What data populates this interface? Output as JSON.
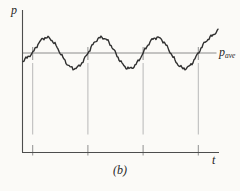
{
  "window": {
    "width": 240,
    "height": 191
  },
  "labels": {
    "y_axis": "p",
    "x_axis": "t",
    "caption": "(b)",
    "mean": {
      "main": "p",
      "sub": "ave"
    }
  },
  "colors": {
    "background": "#fbfaf7",
    "axis": "#4d4d4d",
    "curve": "#303030",
    "mean_line": "#8c8c8c",
    "guide_line": "#b8b8b8",
    "guide_tick": "#909090",
    "text": "#1f1f1f"
  },
  "chart_data": {
    "type": "line",
    "title": "",
    "xlabel": "t",
    "ylabel": "p",
    "mean_line_label": "p_ave",
    "cycles_shown": 3.4,
    "grid": false,
    "axes": {
      "origin_px": [
        22,
        152.5
      ],
      "y_top_px": 10,
      "x_right_px": 219
    },
    "mean_y_px": 53,
    "mean_x_range_px": [
      23,
      216.5
    ],
    "amplitude_px": 15.5,
    "period_px": 55.2,
    "first_rising_crossing_x_px": 32.7,
    "rising_crossings_x_px": [
      32.7,
      87.9,
      143.1,
      198.3
    ],
    "curve_x_range_px": [
      23,
      218
    ],
    "curve_start_y_px": 61,
    "tail_start_x_px": 206,
    "curve_end_px": [
      218,
      30.5
    ],
    "noise_components": [
      [
        0.9,
        0.85,
        1.3
      ],
      [
        0.7,
        1.9,
        0.4
      ],
      [
        0.45,
        3.7,
        2.1
      ]
    ],
    "guide_segments_y_px": {
      "top_tick": [
        47,
        60
      ],
      "main": [
        63,
        134.5
      ],
      "bottom_tick": [
        145,
        155.5
      ]
    },
    "stroke_widths": {
      "curve": 1.4,
      "axis": 1.1,
      "mean": 1.0,
      "guide": 1.0
    }
  }
}
